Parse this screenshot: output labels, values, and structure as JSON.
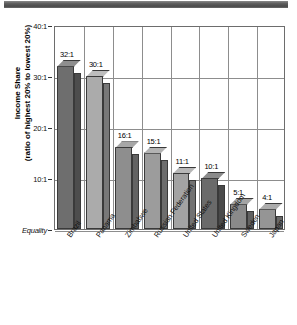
{
  "decor": {
    "top_band": "dark-gray-band"
  },
  "chart_data": {
    "type": "bar",
    "title": "",
    "xlabel": "",
    "ylabel": "Income Share (ratio of highest 20% to lowest 20%)",
    "ylabel_line1": "Income Share",
    "ylabel_line2": "(ratio of highest 20% to lowest 20%)",
    "categories": [
      "Brazil",
      "Panama",
      "Zimbabwe",
      "Russian Federation",
      "United States",
      "United Kingdom",
      "Sweden",
      "Japan"
    ],
    "values": [
      32,
      30,
      16,
      15,
      11,
      10,
      5,
      4
    ],
    "value_labels": [
      "32:1",
      "30:1",
      "16:1",
      "15:1",
      "11:1",
      "10:1",
      "5:1",
      "4:1"
    ],
    "ylim": [
      0,
      40
    ],
    "ytick_values": [
      40,
      30,
      20,
      10,
      0
    ],
    "ytick_labels": [
      "40:1",
      "30:1",
      "20:1",
      "10:1",
      "Equality"
    ],
    "baseline_label": "Equality",
    "grid": true,
    "legend": "none",
    "series_colors": [
      "#6e6e6e",
      "#ababab",
      "#8e8e8e",
      "#9c9c9c",
      "#a3a3a3",
      "#6a6a6a",
      "#8a8a8a",
      "#959595"
    ]
  }
}
